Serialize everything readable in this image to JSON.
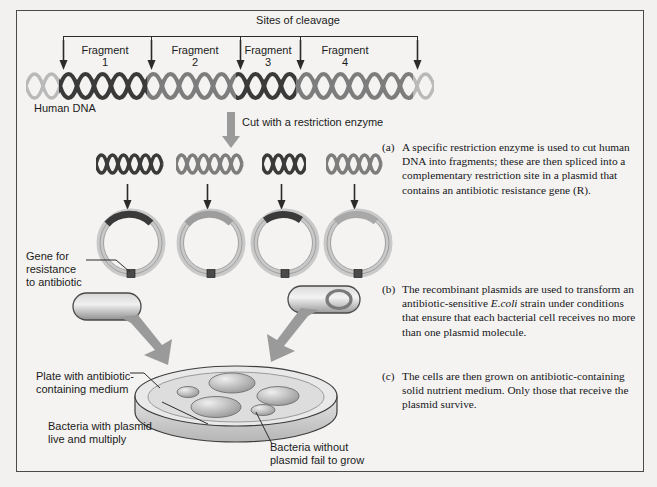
{
  "figure": {
    "background_color": "#f4f3f1",
    "border_color": "#4a4a4a",
    "ink_color": "#2b2b2b"
  },
  "top_section": {
    "sites_of_cleavage_label": "Sites of cleavage",
    "human_dna_label": "Human DNA",
    "fragments": [
      {
        "name": "Fragment",
        "number": "1",
        "shade": "#3a3a3a"
      },
      {
        "name": "Fragment",
        "number": "2",
        "shade": "#7d7d7d"
      },
      {
        "name": "Fragment",
        "number": "3",
        "shade": "#3a3a3a"
      },
      {
        "name": "Fragment",
        "number": "4",
        "shade": "#7d7d7d"
      }
    ],
    "cleavage_site_count": 5
  },
  "cut_step": {
    "label": "Cut with a restriction enzyme",
    "arrow": "thick-down-arrow"
  },
  "plasmid_section": {
    "gene_label": "Gene for\nresistance\nto antibiotic",
    "resistance_marker": "R",
    "plasmid_count": 4,
    "inserts": [
      {
        "shade": "#3a3a3a"
      },
      {
        "shade": "#7d7d7d"
      },
      {
        "shade": "#3a3a3a"
      },
      {
        "shade": "#7d7d7d"
      }
    ]
  },
  "bacteria_section": {
    "cell_without_plasmid": "bacterium-without-plasmid",
    "cell_with_plasmid": "bacterium-with-plasmid"
  },
  "plate_section": {
    "plate_label": "Plate with antibiotic-\ncontaining medium",
    "live_label": "Bacteria with plasmid\nlive and multiply",
    "fail_label": "Bacteria without\nplasmid fail to grow",
    "large_colonies": 3,
    "small_colonies": 2
  },
  "panels": [
    {
      "tag": "(a)",
      "text_before": "A specific restriction enzyme is used to cut human DNA into fragments; these are then spliced into a complementary restriction site in a plasmid that contains an antibiotic resistance gene (R)."
    },
    {
      "tag": "(b)",
      "text_before": "The recombinant plasmids are used to transform an antibiotic-sensitive ",
      "italic": "E.coli",
      "text_after": " strain under conditions that ensure that each bacterial cell receives no more than one plasmid molecule."
    },
    {
      "tag": "(c)",
      "text_before": "The cells are then grown on antibiotic-containing solid nutrient medium. Only those that receive the plasmid survive."
    }
  ]
}
